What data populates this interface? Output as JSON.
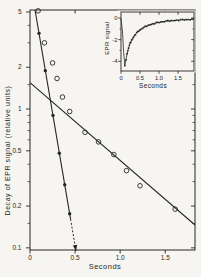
{
  "figure": {
    "bg_color": "#f6f5f1",
    "ink_color": "#262624"
  },
  "chart_data": [
    {
      "id": "main-decay-plot",
      "type": "scatter",
      "yscale": "log",
      "title": "",
      "xlabel": "Seconds",
      "ylabel": "Decay of EPR signal (relative units)",
      "xlim": [
        0,
        1.83
      ],
      "ylim": [
        0.0965,
        5.17
      ],
      "x_major_ticks": [
        0,
        0.5,
        1.0,
        1.5
      ],
      "x_tick_labels": [
        "0",
        "0.5",
        "1.0",
        "1.5"
      ],
      "y_major_ticks": [
        5,
        2,
        1,
        0.5,
        0.2,
        0.1
      ],
      "y_tick_labels": [
        "5",
        "2",
        "1",
        "0.5",
        "0.2",
        "0.1"
      ],
      "y_minor_ticks": [
        4,
        3,
        1.5,
        0.9,
        0.8,
        0.7,
        0.6,
        0.4,
        0.3,
        0.15
      ],
      "grid": false,
      "series": [
        {
          "name": "observed-decay",
          "marker": "open-circle",
          "points": [
            [
              0.09,
              5.1
            ],
            [
              0.16,
              3.0
            ],
            [
              0.25,
              2.15
            ],
            [
              0.3,
              1.66
            ],
            [
              0.36,
              1.22
            ],
            [
              0.44,
              0.96
            ],
            [
              0.61,
              0.68
            ],
            [
              0.76,
              0.58
            ],
            [
              0.93,
              0.47
            ],
            [
              1.07,
              0.36
            ],
            [
              1.22,
              0.28
            ],
            [
              1.61,
              0.19
            ]
          ]
        },
        {
          "name": "fast-component-peeled",
          "marker": "filled-circle",
          "points": [
            [
              0.1,
              3.51
            ],
            [
              0.17,
              1.89
            ],
            [
              0.255,
              0.9
            ],
            [
              0.325,
              0.48
            ],
            [
              0.385,
              0.285
            ],
            [
              0.44,
              0.176
            ]
          ]
        }
      ],
      "fit_lines": [
        {
          "name": "fast-decay-fit",
          "from": [
            0.056,
            5.17
          ],
          "to": [
            0.51,
            0.095
          ],
          "dash_from": 0.45,
          "arrow_end": true
        },
        {
          "name": "slow-decay-fit",
          "from": [
            0.0,
            1.55
          ],
          "to": [
            1.83,
            0.146
          ],
          "arrow_end": false
        }
      ]
    },
    {
      "id": "inset-transient-plot",
      "type": "line",
      "yscale": "linear",
      "title": "",
      "xlabel": "Seconds",
      "ylabel": "EPR signal",
      "xlim": [
        0,
        1.92
      ],
      "ylim": [
        -4.9,
        0.55
      ],
      "x_major_ticks": [
        0,
        0.5,
        1.0,
        1.5
      ],
      "x_tick_labels": [
        "0",
        "0.5",
        "1.0",
        "1.5"
      ],
      "y_major_ticks": [
        0,
        -2,
        -4
      ],
      "y_tick_labels": [
        "0",
        "-2",
        "-4"
      ],
      "y_minor_ticks": [
        -1,
        -3
      ],
      "grid": false,
      "series": [
        {
          "name": "signal-recovery-transient",
          "marker": "small-square",
          "points": [
            [
              0,
              -0.05
            ],
            [
              0.04,
              -1.3
            ],
            [
              0.07,
              -3.2
            ],
            [
              0.1,
              -4.35
            ],
            [
              0.13,
              -3.9
            ],
            [
              0.16,
              -3.3
            ],
            [
              0.2,
              -2.75
            ],
            [
              0.24,
              -2.35
            ],
            [
              0.28,
              -2.05
            ],
            [
              0.33,
              -1.75
            ],
            [
              0.38,
              -1.5
            ],
            [
              0.44,
              -1.28
            ],
            [
              0.5,
              -1.1
            ],
            [
              0.57,
              -0.93
            ],
            [
              0.64,
              -0.8
            ],
            [
              0.72,
              -0.68
            ],
            [
              0.8,
              -0.58
            ],
            [
              0.88,
              -0.5
            ],
            [
              0.96,
              -0.43
            ],
            [
              1.05,
              -0.37
            ],
            [
              1.14,
              -0.32
            ],
            [
              1.23,
              -0.28
            ],
            [
              1.32,
              -0.25
            ],
            [
              1.42,
              -0.22
            ],
            [
              1.52,
              -0.19
            ],
            [
              1.62,
              -0.17
            ],
            [
              1.72,
              -0.15
            ],
            [
              1.82,
              -0.14
            ],
            [
              1.9,
              -0.13
            ]
          ]
        }
      ]
    }
  ]
}
